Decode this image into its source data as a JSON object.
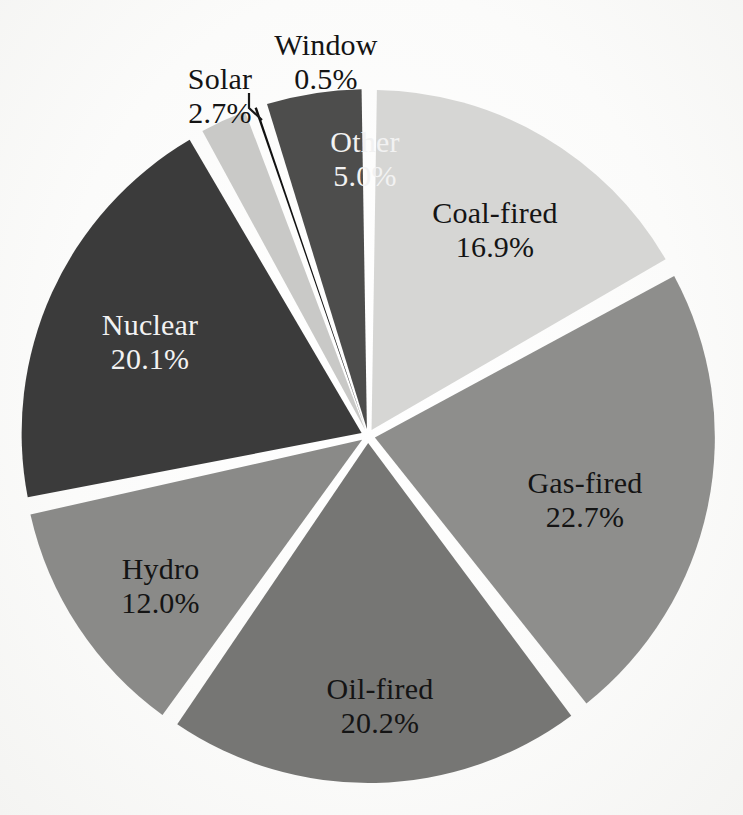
{
  "chart_data": {
    "type": "pie",
    "title": "",
    "subtitle": "",
    "xlabel": "",
    "ylabel": "",
    "units": "%",
    "legend_position": "none",
    "labels_inside_slices": true,
    "exploded": true,
    "grid": false,
    "total": 100.1,
    "categories": [
      "Coal-fired",
      "Gas-fired",
      "Oil-fired",
      "Hydro",
      "Nuclear",
      "Solar",
      "Window",
      "Other"
    ],
    "values": [
      16.9,
      22.7,
      20.2,
      12.0,
      20.1,
      2.7,
      0.5,
      5.0
    ],
    "value_labels": [
      "16.9%",
      "22.7%",
      "20.2%",
      "12.0%",
      "20.1%",
      "2.7%",
      "0.5%",
      "5.0%"
    ],
    "colors": [
      "#d6d6d4",
      "#8e8e8c",
      "#767674",
      "#8a8a88",
      "#3b3b3b",
      "#c9c9c7",
      "#111111",
      "#4d4d4c"
    ],
    "slices": [
      {
        "name": "Coal-fired",
        "value": 16.9,
        "value_label": "16.9%",
        "color": "#d6d6d4",
        "label_color": "dark",
        "label_placement": "inside"
      },
      {
        "name": "Gas-fired",
        "value": 22.7,
        "value_label": "22.7%",
        "color": "#8e8e8c",
        "label_color": "dark",
        "label_placement": "inside"
      },
      {
        "name": "Oil-fired",
        "value": 20.2,
        "value_label": "20.2%",
        "color": "#767674",
        "label_color": "dark",
        "label_placement": "inside"
      },
      {
        "name": "Hydro",
        "value": 12.0,
        "value_label": "12.0%",
        "color": "#8a8a88",
        "label_color": "dark",
        "label_placement": "inside"
      },
      {
        "name": "Nuclear",
        "value": 20.1,
        "value_label": "20.1%",
        "color": "#3b3b3b",
        "label_color": "light",
        "label_placement": "inside"
      },
      {
        "name": "Solar",
        "value": 2.7,
        "value_label": "2.7%",
        "color": "#c9c9c7",
        "label_color": "dark",
        "label_placement": "outside"
      },
      {
        "name": "Window",
        "value": 0.5,
        "value_label": "0.5%",
        "color": "#111111",
        "label_color": "dark",
        "label_placement": "outside-leader"
      },
      {
        "name": "Other",
        "value": 5.0,
        "value_label": "5.0%",
        "color": "#4d4d4c",
        "label_color": "light",
        "label_placement": "inside"
      }
    ]
  },
  "labels": {
    "coal": {
      "name": "Coal-fired",
      "value": "16.9%"
    },
    "gas": {
      "name": "Gas-fired",
      "value": "22.7%"
    },
    "oil": {
      "name": "Oil-fired",
      "value": "20.2%"
    },
    "hydro": {
      "name": "Hydro",
      "value": "12.0%"
    },
    "nuclear": {
      "name": "Nuclear",
      "value": "20.1%"
    },
    "solar": {
      "name": "Solar",
      "value": "2.7%"
    },
    "window": {
      "name": "Window",
      "value": "0.5%"
    },
    "other": {
      "name": "Other",
      "value": "5.0%"
    }
  },
  "style": {
    "background": "#fdfdfc",
    "separator_color": "#ffffff",
    "label_dark": "#141414",
    "label_light": "#f2f2f2"
  }
}
